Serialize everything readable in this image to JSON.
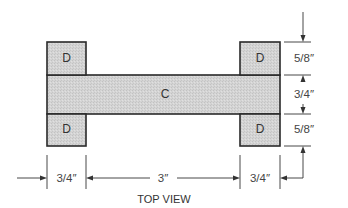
{
  "diagram": {
    "caption": "TOP VIEW",
    "parts": {
      "center": {
        "label": "C"
      },
      "top_left": {
        "label": "D"
      },
      "top_right": {
        "label": "D"
      },
      "bottom_left": {
        "label": "D"
      },
      "bottom_right": {
        "label": "D"
      }
    },
    "dimensions": {
      "vertical": [
        {
          "label": "5/8″"
        },
        {
          "label": "3/4″"
        },
        {
          "label": "5/8″"
        }
      ],
      "horizontal": [
        {
          "label": "3/4″"
        },
        {
          "label": "3″"
        },
        {
          "label": "3/4″"
        }
      ]
    },
    "colors": {
      "fill": "#d2d2d2",
      "stroke": "#2a2a2a"
    }
  }
}
